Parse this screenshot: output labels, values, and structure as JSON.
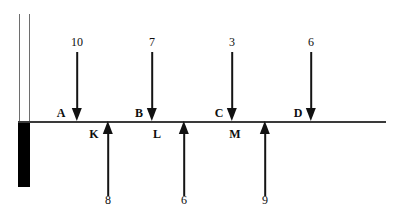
{
  "diagram": {
    "type": "beam-free-body-diagram",
    "colors": {
      "beam": "#3a3a3a",
      "wall_block": "#000000",
      "wall_line": "#6e6e6e",
      "arrow": "#111111",
      "text": "#0e0e0e",
      "background": "#ffffff"
    },
    "beam_line": {
      "x_start": 18,
      "x_end": 386,
      "y": 121,
      "thickness": 1.6
    },
    "wall": {
      "line_left_x": 19,
      "line_right_x": 30,
      "line_top_y": 14,
      "line_bottom_y": 121,
      "block_x": 18,
      "block_y": 121,
      "block_width": 12,
      "block_height": 66
    },
    "downward_loads": [
      {
        "label": "A",
        "magnitude": "10",
        "x": 77,
        "label_x": 61,
        "magnitude_y": 47,
        "shaft_top_y": 52,
        "tip_y": 121
      },
      {
        "label": "B",
        "magnitude": "7",
        "x": 152,
        "label_x": 139,
        "magnitude_y": 47,
        "shaft_top_y": 52,
        "tip_y": 121
      },
      {
        "label": "C",
        "magnitude": "3",
        "x": 232,
        "label_x": 219,
        "magnitude_y": 47,
        "shaft_top_y": 52,
        "tip_y": 121
      },
      {
        "label": "D",
        "magnitude": "6",
        "x": 311,
        "label_x": 298,
        "magnitude_y": 47,
        "shaft_top_y": 52,
        "tip_y": 121
      }
    ],
    "upward_loads": [
      {
        "label": "K",
        "magnitude": "8",
        "x": 108,
        "label_x": 93,
        "magnitude_y": 205,
        "shaft_bottom_y": 196,
        "tip_y": 121
      },
      {
        "label": "L",
        "magnitude": "6",
        "x": 184,
        "label_x": 156,
        "magnitude_y": 205,
        "shaft_bottom_y": 196,
        "tip_y": 121
      },
      {
        "label": "M",
        "magnitude": "9",
        "x": 265,
        "label_x": 234,
        "magnitude_y": 205,
        "shaft_bottom_y": 196,
        "tip_y": 121
      }
    ]
  }
}
